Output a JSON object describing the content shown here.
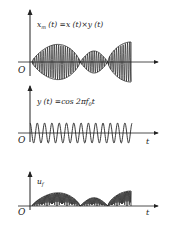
{
  "figure": {
    "panels": [
      {
        "id": "modulated",
        "label": "xₘ(t)=x(t)×y(t)",
        "label_parts": {
          "var": "x",
          "sub": "m",
          "rest": " (t) =x (t)×y (t)"
        },
        "origin_label": "O",
        "axis_label": ""
      },
      {
        "id": "carrier",
        "label": "y (t) =cos 2πf₀t",
        "label_parts": {
          "prefix": "y (t) =cos 2π",
          "var": "f",
          "sub": "0",
          "suffix": "t"
        },
        "origin_label": "O",
        "axis_label": "t"
      },
      {
        "id": "rectified",
        "label": "u_f",
        "label_parts": {
          "var": "u",
          "sub": "f"
        },
        "origin_label": "O",
        "axis_label": "t"
      }
    ],
    "colors": {
      "ink": "#222222",
      "background": "#ffffff"
    }
  }
}
